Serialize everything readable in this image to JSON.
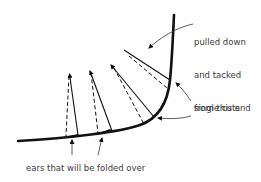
{
  "diagram": {
    "type": "cutting-illustration",
    "labels": {
      "top_right": [
        "pulled down",
        "and tacked",
        "from this end"
      ],
      "right": "single cuts",
      "bottom": "ears that will be folded over"
    },
    "colors": {
      "stroke": "#111111",
      "text": "#3a3a3a",
      "background": "#ffffff"
    },
    "elements": {
      "curve": "main curved edge",
      "cuts": 4,
      "dashed_lines": 4
    }
  }
}
